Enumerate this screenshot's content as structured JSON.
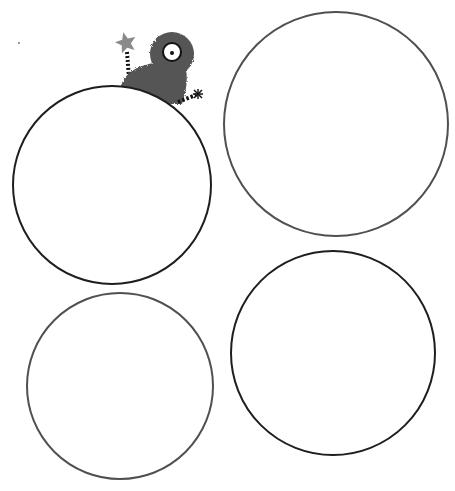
{
  "page": {
    "description": "Worksheet with four empty circles and a cartoon monster peeking over the top-left circle"
  },
  "colors": {
    "background": "#ffffff",
    "circle_dark": "#1e1e1e",
    "circle_gray": "#505050",
    "monster_fur": "#555555",
    "star": "#8a8a8a",
    "eye_white": "#ffffff",
    "eye_outline": "#111111",
    "pupil": "#111111",
    "speck": "#777777"
  },
  "circles": [
    {
      "id": "top-left",
      "cx": 112,
      "cy": 185,
      "r": 99,
      "stroke": "#1e1e1e",
      "stroke_width": 2
    },
    {
      "id": "top-right",
      "cx": 336,
      "cy": 124,
      "r": 112,
      "stroke": "#505050",
      "stroke_width": 2
    },
    {
      "id": "bottom-left",
      "cx": 120,
      "cy": 386,
      "r": 93,
      "stroke": "#505050",
      "stroke_width": 2
    },
    {
      "id": "bottom-right",
      "cx": 333,
      "cy": 353,
      "r": 102,
      "stroke": "#1e1e1e",
      "stroke_width": 2
    }
  ],
  "monster": {
    "head": {
      "cx": 172,
      "cy": 54,
      "r": 22
    },
    "eye": {
      "cx": 172,
      "cy": 52,
      "r": 9
    },
    "pupil": {
      "cx": 172,
      "cy": 53,
      "r": 2
    },
    "star": {
      "cx": 126,
      "cy": 43,
      "r": 11
    },
    "star_stick": {
      "x1": 127,
      "y1": 52,
      "x2": 129,
      "y2": 78
    },
    "right_arm": {
      "x1": 178,
      "y1": 102,
      "x2": 196,
      "y2": 95
    },
    "right_hand": {
      "cx": 198,
      "cy": 94
    }
  },
  "speck": {
    "cx": 19,
    "cy": 43,
    "r": 1
  }
}
